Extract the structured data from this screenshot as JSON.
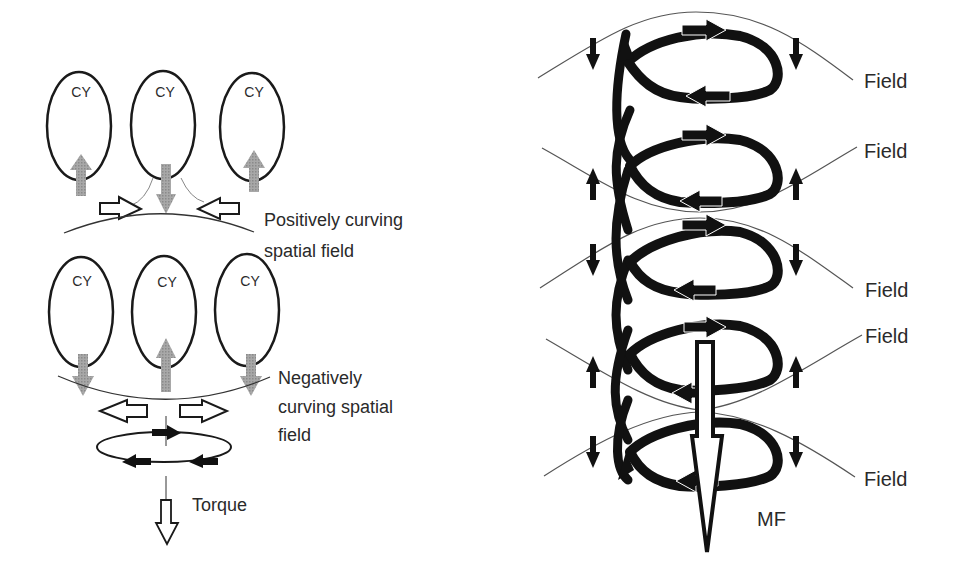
{
  "left_panel": {
    "top_row": {
      "cy_labels": [
        "CY",
        "CY",
        "CY"
      ],
      "caption_line1": "Positively curving",
      "caption_line2": "spatial field"
    },
    "bottom_row": {
      "cy_labels": [
        "CY",
        "CY",
        "CY"
      ],
      "caption_line1": "Negatively",
      "caption_line2": "curving spatial",
      "caption_line3": "field"
    },
    "torque_label": "Torque"
  },
  "right_panel": {
    "field_labels": [
      "Field",
      "Field",
      "Field",
      "Field",
      "Field"
    ],
    "mf_label": "MF"
  },
  "colors": {
    "line": "#1a1a1a",
    "gray_arrow": "#9a9a9a",
    "field_line": "#555555"
  }
}
